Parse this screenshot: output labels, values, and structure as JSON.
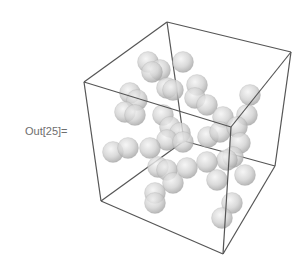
{
  "cell": {
    "output_label": "Out[25]="
  },
  "graphic": {
    "type": "Graphics3D",
    "box_color": "#555555",
    "sphere_color": "#cfcfcf",
    "sphere_radius": 10.5,
    "box_vertices": {
      "left_top": [
        84,
        82
      ],
      "back_top": [
        167,
        22
      ],
      "right_top": [
        291,
        52
      ],
      "front_top": [
        231,
        127
      ],
      "left_bottom": [
        101,
        201
      ],
      "back_bottom": [
        184,
        141
      ],
      "right_bottom": [
        275,
        166
      ],
      "front_bottom": [
        223,
        254
      ]
    },
    "spheres": [
      [
        148,
        62
      ],
      [
        160,
        70
      ],
      [
        183,
        62
      ],
      [
        152,
        72
      ],
      [
        167,
        88
      ],
      [
        173,
        90
      ],
      [
        130,
        93
      ],
      [
        137,
        100
      ],
      [
        125,
        112
      ],
      [
        135,
        115
      ],
      [
        197,
        85
      ],
      [
        195,
        98
      ],
      [
        207,
        105
      ],
      [
        223,
        117
      ],
      [
        250,
        95
      ],
      [
        247,
        115
      ],
      [
        163,
        115
      ],
      [
        170,
        127
      ],
      [
        180,
        133
      ],
      [
        167,
        140
      ],
      [
        183,
        142
      ],
      [
        208,
        137
      ],
      [
        220,
        132
      ],
      [
        237,
        127
      ],
      [
        240,
        143
      ],
      [
        233,
        157
      ],
      [
        227,
        160
      ],
      [
        113,
        152
      ],
      [
        128,
        148
      ],
      [
        150,
        148
      ],
      [
        158,
        167
      ],
      [
        167,
        170
      ],
      [
        187,
        168
      ],
      [
        173,
        183
      ],
      [
        207,
        162
      ],
      [
        217,
        180
      ],
      [
        245,
        175
      ],
      [
        155,
        193
      ],
      [
        155,
        203
      ],
      [
        232,
        203
      ],
      [
        222,
        218
      ]
    ]
  }
}
